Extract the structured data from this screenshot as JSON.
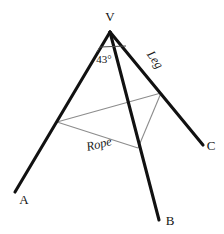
{
  "figure": {
    "canvas": {
      "width": 224,
      "height": 234,
      "background": "#ffffff"
    },
    "colors": {
      "leg_stroke": "#111111",
      "rope_stroke": "#8c8c8c",
      "arc_stroke": "#4a4a4a",
      "text": "#141414",
      "background": "#ffffff"
    },
    "apex": {
      "name": "V",
      "x": 110,
      "y": 32
    },
    "legs": [
      {
        "name": "leg-VA",
        "from": "V",
        "to": "A",
        "x1": 110,
        "y1": 32,
        "x2": 15,
        "y2": 192,
        "width": 3.1
      },
      {
        "name": "leg-VB",
        "from": "V",
        "to": "B",
        "x1": 110,
        "y1": 32,
        "x2": 159,
        "y2": 220,
        "width": 3.1
      },
      {
        "name": "leg-VC",
        "from": "V",
        "to": "C",
        "x1": 110,
        "y1": 32,
        "x2": 203,
        "y2": 145,
        "width": 3.1
      }
    ],
    "endpoint_labels": [
      {
        "name": "vertex-label-V",
        "text": "V",
        "x": 110,
        "y": 21,
        "anchor": "middle"
      },
      {
        "name": "vertex-label-A",
        "text": "A",
        "x": 24,
        "y": 204,
        "anchor": "middle"
      },
      {
        "name": "vertex-label-B",
        "text": "B",
        "x": 170,
        "y": 225,
        "anchor": "middle"
      },
      {
        "name": "vertex-label-C",
        "text": "C",
        "x": 211,
        "y": 150,
        "anchor": "middle"
      }
    ],
    "rope": {
      "name": "rope-quadrilateral",
      "stroke": "#8c8c8c",
      "width": 1.1,
      "points": [
        {
          "name": "rope-point-on-leg-VA",
          "x": 57,
          "y": 122
        },
        {
          "name": "rope-point-on-leg-VC",
          "x": 161,
          "y": 93
        },
        {
          "name": "rope-point-on-leg-VB",
          "x": 138,
          "y": 148
        }
      ],
      "path": "M 57 122 L 161 93 L 138 148 Z"
    },
    "angle": {
      "name": "apex-angle",
      "value": "43",
      "unit": "°",
      "label": "43°",
      "label_x": 104,
      "label_y": 63,
      "arc_path": "M 97 52 L 100 47 L 126 46"
    },
    "side_labels": [
      {
        "name": "label-leg",
        "text": "Leg",
        "x": 152,
        "y": 62,
        "rotation": 55
      },
      {
        "name": "label-rope",
        "text": "Rope",
        "x": 100,
        "y": 148,
        "rotation": -14
      }
    ],
    "margin_flecks": [
      {
        "name": "margin-fleck-top",
        "x": 1,
        "y": 36,
        "width": 3,
        "height": 14
      },
      {
        "name": "margin-fleck-middle",
        "x": 1,
        "y": 117,
        "width": 3,
        "height": 12
      }
    ]
  }
}
